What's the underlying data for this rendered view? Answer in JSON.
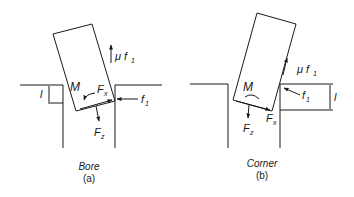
{
  "panels": [
    {
      "id": "a",
      "caption_title": "Bore",
      "caption_sub": "(a)",
      "labels": {
        "moment": "M",
        "fx": "F",
        "fx_sub": "x",
        "fz": "F",
        "fz_sub": "z",
        "f1": "f",
        "f1_sub": "1",
        "mu_f1": "μ f",
        "mu_f1_sub": "1",
        "depth": "l"
      }
    },
    {
      "id": "b",
      "caption_title": "Corner",
      "caption_sub": "(b)",
      "labels": {
        "moment": "M",
        "fx": "F",
        "fx_sub": "x",
        "fz": "F",
        "fz_sub": "z",
        "f1": "f",
        "f1_sub": "1",
        "mu_f1": "μ f",
        "mu_f1_sub": "1",
        "depth": "l"
      }
    }
  ],
  "colors": {
    "line": "#1a1a1a",
    "background": "#ffffff"
  }
}
